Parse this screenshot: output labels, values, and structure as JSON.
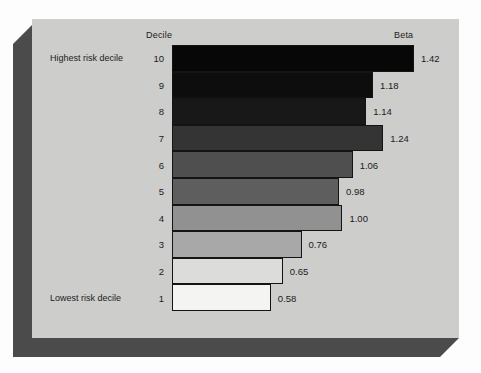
{
  "headers": {
    "left": "Decile",
    "right": "Beta"
  },
  "annotations": {
    "top": "Highest risk decile",
    "bottom": "Lowest risk decile"
  },
  "colors": {
    "page_background": "#fdfdfd",
    "panel_background": "#cdcdcb",
    "shadow": "#4b4b4b",
    "bar_border": "#141414",
    "text": "#1b1b1b"
  },
  "chart_data": {
    "type": "bar",
    "orientation": "horizontal",
    "title": "",
    "subtitle": "",
    "xlabel": "Beta",
    "ylabel": "Decile",
    "grid": false,
    "legend_position": "none",
    "xlim": [
      0,
      1.42
    ],
    "categories": [
      "10",
      "9",
      "8",
      "7",
      "6",
      "5",
      "4",
      "3",
      "2",
      "1"
    ],
    "values": [
      1.42,
      1.18,
      1.14,
      1.24,
      1.06,
      0.98,
      1.0,
      0.76,
      0.65,
      0.58
    ],
    "bars": [
      {
        "decile": "10",
        "value": 1.42,
        "label": "1.42",
        "fill": "#070707",
        "note": "Highest risk decile"
      },
      {
        "decile": "9",
        "value": 1.18,
        "label": "1.18",
        "fill": "#0d0d0d",
        "note": ""
      },
      {
        "decile": "8",
        "value": 1.14,
        "label": "1.14",
        "fill": "#181818",
        "note": ""
      },
      {
        "decile": "7",
        "value": 1.24,
        "label": "1.24",
        "fill": "#343434",
        "note": ""
      },
      {
        "decile": "6",
        "value": 1.06,
        "label": "1.06",
        "fill": "#4f4f4f",
        "note": ""
      },
      {
        "decile": "5",
        "value": 0.98,
        "label": "0.98",
        "fill": "#5e5e5e",
        "note": ""
      },
      {
        "decile": "4",
        "value": 1.0,
        "label": "1.00",
        "fill": "#919191",
        "note": ""
      },
      {
        "decile": "3",
        "value": 0.76,
        "label": "0.76",
        "fill": "#a8a8a8",
        "note": ""
      },
      {
        "decile": "2",
        "value": 0.65,
        "label": "0.65",
        "fill": "#dcdcda",
        "note": ""
      },
      {
        "decile": "1",
        "value": 0.58,
        "label": "0.58",
        "fill": "#f4f4f2",
        "note": "Lowest risk decile"
      }
    ]
  }
}
